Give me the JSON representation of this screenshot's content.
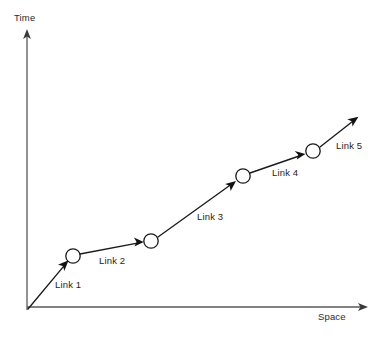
{
  "figure": {
    "kind": "space-time-link-diagram",
    "background_color": "#ffffff",
    "width": 381,
    "height": 339
  },
  "axes": {
    "y_axis": {
      "label": "Time",
      "label_x": 14,
      "label_y": 12,
      "color": "#59595b",
      "origin_x": 27,
      "origin_y": 310,
      "tip_x": 27,
      "tip_y": 30,
      "arrow": "arrow-up"
    },
    "x_axis": {
      "label": "Space",
      "label_x": 318,
      "label_y": 311,
      "color": "#59595b",
      "origin_x": 27,
      "origin_y": 307,
      "tip_x": 367,
      "tip_y": 307,
      "arrow": "arrow-right"
    }
  },
  "nodes": [
    {
      "id": "node-1",
      "cx": 73,
      "cy": 256,
      "r": 7.2,
      "fill": "#ffffff",
      "stroke": "#1a1a1a"
    },
    {
      "id": "node-2",
      "cx": 151,
      "cy": 241,
      "r": 7.2,
      "fill": "#ffffff",
      "stroke": "#1a1a1a"
    },
    {
      "id": "node-3",
      "cx": 243,
      "cy": 176,
      "r": 7.2,
      "fill": "#ffffff",
      "stroke": "#1a1a1a"
    },
    {
      "id": "node-4",
      "cx": 313,
      "cy": 151,
      "r": 7.2,
      "fill": "#ffffff",
      "stroke": "#1a1a1a"
    }
  ],
  "links": [
    {
      "id": "link-1",
      "label": "Link 1",
      "x1": 28,
      "y1": 309,
      "x2": 68,
      "y2": 261,
      "label_x": 55,
      "label_y": 279,
      "color": "#1a1a1a"
    },
    {
      "id": "link-2",
      "label": "Link 2",
      "x1": 80,
      "y1": 254,
      "x2": 143,
      "y2": 242,
      "label_x": 99,
      "label_y": 255,
      "color": "#1a1a1a"
    },
    {
      "id": "link-3",
      "label": "Link 3",
      "x1": 158,
      "y1": 237,
      "x2": 236,
      "y2": 181,
      "label_x": 197,
      "label_y": 211,
      "color": "#1a1a1a"
    },
    {
      "id": "link-4",
      "label": "Link 4",
      "x1": 250,
      "y1": 173,
      "x2": 305,
      "y2": 154,
      "label_x": 272,
      "label_y": 167,
      "color": "#1a1a1a"
    },
    {
      "id": "link-5",
      "label": "Link 5",
      "x1": 320,
      "y1": 147,
      "x2": 358,
      "y2": 117,
      "label_x": 336,
      "label_y": 140,
      "color": "#1a1a1a"
    }
  ]
}
